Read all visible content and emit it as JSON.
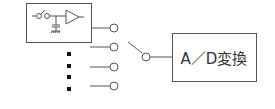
{
  "diagram": {
    "title": "",
    "nodes": [
      {
        "id": "input-circuit",
        "type": "box",
        "contains": [
          "switch",
          "capacitor-to-ground",
          "amplifier"
        ]
      },
      {
        "id": "mux-inputs",
        "type": "terminal-list",
        "count_visible": 4,
        "ellipsis": "vertical-dots"
      },
      {
        "id": "selector-switch",
        "type": "switch"
      },
      {
        "id": "ad-converter",
        "type": "box",
        "label": "A／D変換"
      }
    ],
    "edges": [
      {
        "from": "input-circuit",
        "to": "mux-inputs.0"
      },
      {
        "from": "selector-switch",
        "to": "ad-converter"
      }
    ],
    "colors": {
      "stroke": "#555555",
      "text": "#333333",
      "dots": "#111111",
      "background": "#ffffff"
    }
  },
  "ad_box": {
    "label": "A／D変換"
  }
}
